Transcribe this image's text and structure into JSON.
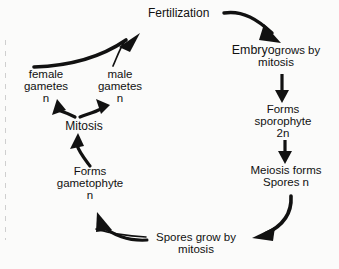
{
  "diagram": {
    "background_color": "#fbfbfa",
    "stroke_color": "#111111",
    "nodes": {
      "fertilization": {
        "label": "Fertilization"
      },
      "embryo": {
        "lead": "Embryo",
        "inline": "grows by",
        "line2": "mitosis"
      },
      "sporophyte": {
        "line1": "Forms",
        "line2": "sporophyte",
        "line3": "2n"
      },
      "meiosis": {
        "line1": "Meiosis forms",
        "line2": "Spores n"
      },
      "spores_grow": {
        "line1": "Spores grow by",
        "line2": "mitosis"
      },
      "gametophyte": {
        "line1": "Forms",
        "line2": "gametophyte",
        "line3": "n"
      },
      "mitosis": {
        "label": "Mitosis"
      },
      "female_gametes": {
        "line1": "female",
        "line2": "gametes",
        "line3": "n"
      },
      "male_gametes": {
        "line1": "male",
        "line2": "gametes",
        "line3": "n"
      }
    },
    "arrows": [
      {
        "name": "fertilization-to-embryo",
        "from": "Fertilization",
        "to": "Embryo grows by mitosis"
      },
      {
        "name": "embryo-to-sporophyte",
        "from": "Embryo grows by mitosis",
        "to": "Forms sporophyte 2n"
      },
      {
        "name": "sporophyte-to-meiosis",
        "from": "Forms sporophyte 2n",
        "to": "Meiosis forms Spores n"
      },
      {
        "name": "meiosis-to-spores-grow",
        "from": "Meiosis forms Spores n",
        "to": "Spores grow by mitosis"
      },
      {
        "name": "spores-grow-to-gametophyte",
        "from": "Spores grow by mitosis",
        "to": "Forms gametophyte n"
      },
      {
        "name": "gametophyte-to-mitosis",
        "from": "Forms gametophyte n",
        "to": "Mitosis"
      },
      {
        "name": "mitosis-to-female-gametes",
        "from": "Mitosis",
        "to": "female gametes n"
      },
      {
        "name": "mitosis-to-male-gametes",
        "from": "Mitosis",
        "to": "male gametes n"
      },
      {
        "name": "gametes-to-fertilization",
        "from": "female and male gametes n",
        "to": "Fertilization"
      }
    ]
  }
}
